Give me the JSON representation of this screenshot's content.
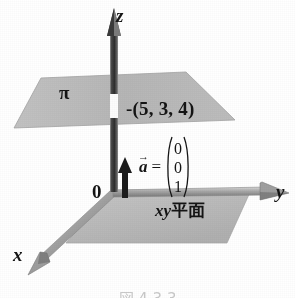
{
  "figure": {
    "type": "3d-coordinate-diagram",
    "background_color": "#ffffff",
    "caption": "図 4.3.3"
  },
  "axes": {
    "z_label": "z",
    "y_label": "y",
    "x_label": "x",
    "origin_label": "0",
    "axis_color": "#6b6b6b",
    "axis_dark_color": "#3a3a3a"
  },
  "planes": {
    "upper": {
      "label": "π",
      "fill_color": "#b9b9b9"
    },
    "base": {
      "label_prefix": "xy",
      "label_suffix": "平面",
      "fill_color": "#bcbcbc"
    }
  },
  "point": {
    "marker": "-",
    "label": "-(5, 3, 4)",
    "coordinates": [
      5,
      3,
      4
    ]
  },
  "vector": {
    "name": "a",
    "accent": "→",
    "equals": "=",
    "components": [
      "0",
      "0",
      "1"
    ],
    "arrow_color": "#1a1a1a"
  }
}
